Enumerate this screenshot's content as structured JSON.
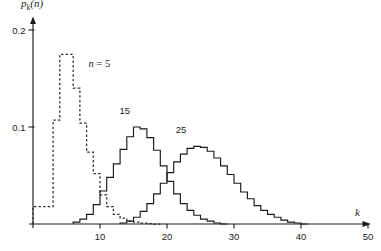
{
  "figure": {
    "background_color": "#ffffff",
    "ink_color": "#1a1a1a"
  },
  "chart_data": {
    "type": "line",
    "title": "",
    "subtitle": "",
    "xlabel": "k",
    "ylabel": "p_k(n)",
    "ylabel_base": "p",
    "ylabel_sub": "k",
    "ylabel_arg": "(n)",
    "xlim": [
      0,
      50
    ],
    "ylim": [
      0,
      0.215
    ],
    "grid": false,
    "legend_position": "inline-annotations",
    "xticks": [
      10,
      20,
      30,
      40,
      50
    ],
    "xtick_labels": [
      "10",
      "20",
      "30",
      "40",
      "50"
    ],
    "yticks": [
      0.1,
      0.2
    ],
    "ytick_labels": [
      "0.1",
      "0.2"
    ],
    "drawstyle": "steps-post",
    "series": [
      {
        "name": "n = 5",
        "label": "n = 5",
        "label_style": "italic",
        "linestyle": "dashed",
        "color": "#2b2b2b",
        "label_x": 8.3,
        "label_y": 0.162,
        "x": [
          0,
          1,
          2,
          3,
          4,
          5,
          6,
          7,
          8,
          9,
          10,
          11,
          12,
          13,
          14,
          15,
          16,
          17,
          18
        ],
        "values": [
          0.018,
          0.018,
          0.018,
          0.107,
          0.175,
          0.175,
          0.14,
          0.104,
          0.074,
          0.052,
          0.03,
          0.018,
          0.01,
          0.006,
          0.003,
          0.002,
          0.001,
          0.0005,
          0.0
        ]
      },
      {
        "name": "15",
        "label": "15",
        "label_style": "normal",
        "linestyle": "solid",
        "color": "#1a1a1a",
        "label_x": 13.7,
        "label_y": 0.113,
        "x": [
          6,
          7,
          8,
          9,
          10,
          11,
          12,
          13,
          14,
          15,
          16,
          17,
          18,
          19,
          20,
          21,
          22,
          23,
          24,
          25,
          26,
          27,
          28
        ],
        "values": [
          0.002,
          0.005,
          0.01,
          0.02,
          0.034,
          0.048,
          0.062,
          0.077,
          0.09,
          0.1,
          0.098,
          0.089,
          0.076,
          0.06,
          0.044,
          0.031,
          0.021,
          0.014,
          0.009,
          0.005,
          0.003,
          0.001,
          0.0
        ]
      },
      {
        "name": "25",
        "label": "25",
        "label_style": "normal",
        "linestyle": "solid",
        "color": "#1a1a1a",
        "label_x": 22.1,
        "label_y": 0.094,
        "x": [
          13,
          14,
          15,
          16,
          17,
          18,
          19,
          20,
          21,
          22,
          23,
          24,
          25,
          26,
          27,
          28,
          29,
          30,
          31,
          32,
          33,
          34,
          35,
          36,
          37,
          38,
          39,
          40
        ],
        "values": [
          0.001,
          0.003,
          0.007,
          0.013,
          0.021,
          0.031,
          0.042,
          0.053,
          0.064,
          0.072,
          0.078,
          0.08,
          0.079,
          0.075,
          0.068,
          0.06,
          0.051,
          0.042,
          0.033,
          0.026,
          0.019,
          0.014,
          0.01,
          0.007,
          0.004,
          0.002,
          0.001,
          0.0
        ]
      }
    ]
  }
}
